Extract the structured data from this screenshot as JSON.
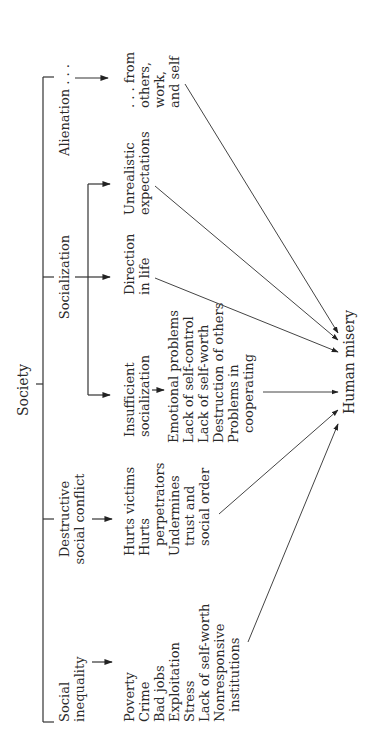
{
  "diagram": {
    "root": "Society",
    "outcome": "Human misery",
    "branches": {
      "alienation": {
        "label": "Alienation . . .",
        "effects": [
          ". . . from",
          "others,",
          "work,",
          "and self"
        ]
      },
      "socialization": {
        "label": "Socialization",
        "sub": {
          "unrealistic": [
            "Unrealistic",
            "expectations"
          ],
          "direction": [
            "Direction",
            "in life"
          ],
          "insufficient": [
            "Insufficient",
            "socialization"
          ]
        },
        "insufficient_effects": [
          "Emotional problems",
          "Lack of self-control",
          "Lack of self-worth",
          "Destruction of others",
          "Problems in",
          "cooperating"
        ]
      },
      "destructive_conflict": {
        "label": [
          "Destructive",
          "social conflict"
        ],
        "effects": [
          "Hurts victims",
          "Hurts",
          "perpetrators",
          "Undermines",
          "trust and",
          "social order"
        ]
      },
      "social_inequality": {
        "label": [
          "Social",
          "inequality"
        ],
        "effects": [
          "Poverty",
          "Crime",
          "Bad jobs",
          "Exploitation",
          "Stress",
          "Lack of self-worth",
          "Nonresponsive",
          "institutions"
        ]
      }
    }
  }
}
